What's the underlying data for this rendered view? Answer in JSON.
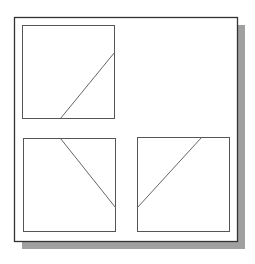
{
  "diagram": {
    "title": "",
    "type": "orthographic-views",
    "colors": {
      "background": "#ffffff",
      "frame_border": "#333333",
      "shadow": "#a0a0a0",
      "view_border": "#555555",
      "edge_line": "#666666"
    },
    "frame": {
      "x": 14,
      "y": 17,
      "width": 223,
      "height": 224,
      "shadow_offset": 8
    },
    "views": [
      {
        "name": "top-view",
        "box": {
          "x": 22,
          "y": 25,
          "width": 92,
          "height": 93
        },
        "line": {
          "x1": 60,
          "y1": 118,
          "x2": 114,
          "y2": 52
        }
      },
      {
        "name": "front-view",
        "box": {
          "x": 23,
          "y": 138,
          "width": 92,
          "height": 93
        },
        "line": {
          "x1": 60,
          "y1": 138,
          "x2": 115,
          "y2": 207
        }
      },
      {
        "name": "side-view",
        "box": {
          "x": 137,
          "y": 137,
          "width": 92,
          "height": 94
        },
        "line": {
          "x1": 137,
          "y1": 207,
          "x2": 201,
          "y2": 137
        }
      }
    ]
  }
}
